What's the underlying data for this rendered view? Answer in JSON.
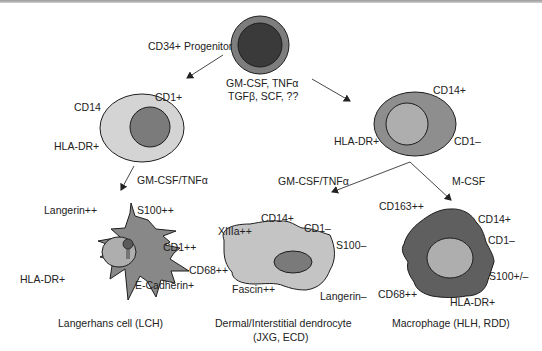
{
  "progenitor": {
    "label": "CD34+ Progenitor",
    "factors_line1": "GM-CSF, TNFα",
    "factors_line2": "TGFβ, SCF, ??"
  },
  "left_precursor": {
    "markers": {
      "cd14": "CD14",
      "cd1": "CD1+",
      "hla": "HLA-DR+"
    },
    "pathway_factor": "GM-CSF/TNFα"
  },
  "right_precursor": {
    "markers": {
      "cd14": "CD14+",
      "hla": "HLA-DR+",
      "cd1": "CD1–"
    },
    "pathway_factor_left": "GM-CSF/TNFα",
    "pathway_factor_right": "M-CSF"
  },
  "langerhans_cell": {
    "markers": {
      "langerin": "Langerin++",
      "s100": "S100++",
      "cd1": "CD1++",
      "hla": "HLA-DR+",
      "ecadherin": "E-Cadherin+"
    },
    "caption": "Langerhans cell (LCH)"
  },
  "dendrocyte": {
    "markers": {
      "xiiia": "XIIIa++",
      "cd14": "CD14+",
      "cd1": "CD1–",
      "s100": "S100–",
      "cd68": "CD68++",
      "fascin": "Fascin++",
      "langerin": "Langerin–"
    },
    "caption_line1": "Dermal/Interstitial dendrocyte",
    "caption_line2": "(JXG, ECD)"
  },
  "macrophage": {
    "markers": {
      "cd163": "CD163++",
      "cd14": "CD14+",
      "cd1": "CD1–",
      "s100": "S100+/–",
      "cd68": "CD68++",
      "hla": "HLA-DR+"
    },
    "caption": "Macrophage (HLH, RDD)"
  },
  "colors": {
    "progenitor_outer": "#7d7d7d",
    "progenitor_inner": "#3a3a3a",
    "light_cytoplasm": "#d4d4d4",
    "mid_nucleus": "#7b7b7b",
    "mid_cytoplasm": "#8e8e8e",
    "light_nucleus": "#aeaeae",
    "dark_cytoplasm": "#5f5f5f",
    "langerhans_body": "#888888",
    "dendrocyte_body": "#c4c4c4",
    "dendrocyte_nucleus": "#7a7a7a",
    "outline": "#1e1e1e",
    "arrow": "#333333"
  }
}
